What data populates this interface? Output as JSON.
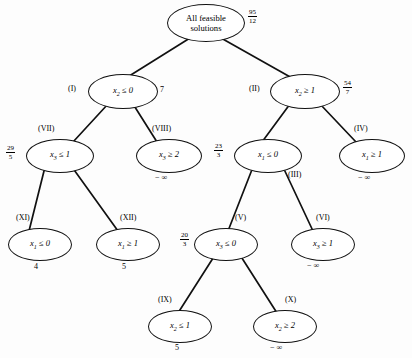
{
  "figure": {
    "edge_color": "#111111",
    "node_border_color": "#111111",
    "background": "#fdfdfd"
  },
  "nodes": [
    {
      "id": "root",
      "tag": "",
      "label_line1": "All feasible",
      "label_line2": "solutions",
      "bound_type": "fraction",
      "bound_num": "95",
      "bound_den": "12",
      "bound_text": "",
      "x": 167,
      "y": 4,
      "w": 76,
      "h": 36,
      "tag_x": 0,
      "tag_y": 0,
      "bound_x": 248,
      "bound_y": 9
    },
    {
      "id": "n1",
      "tag": "(I)",
      "label_var": "x",
      "label_sub": "2",
      "label_rel": "≤ 0",
      "bound_type": "plain",
      "bound_text": "7",
      "x": 88,
      "y": 74,
      "w": 68,
      "h": 33,
      "tag_x": 68,
      "tag_y": 84,
      "bound_x": 160,
      "bound_y": 85
    },
    {
      "id": "n2",
      "tag": "(II)",
      "label_var": "x",
      "label_sub": "2",
      "label_rel": "≥ 1",
      "bound_type": "fraction",
      "bound_num": "54",
      "bound_den": "7",
      "bound_text": "",
      "x": 270,
      "y": 74,
      "w": 68,
      "h": 33,
      "tag_x": 249,
      "tag_y": 84,
      "bound_x": 343,
      "bound_y": 80
    },
    {
      "id": "n7",
      "tag": "(VII)",
      "label_var": "x",
      "label_sub": "3",
      "label_rel": "≤ 1",
      "bound_type": "fraction",
      "bound_num": "29",
      "bound_den": "5",
      "bound_text": "",
      "x": 26,
      "y": 139,
      "w": 66,
      "h": 32,
      "tag_x": 38,
      "tag_y": 124,
      "bound_x": 6,
      "bound_y": 145
    },
    {
      "id": "n8",
      "tag": "(VIII)",
      "label_var": "x",
      "label_sub": "3",
      "label_rel": "≥ 2",
      "bound_type": "neginf",
      "bound_text": "− ∞",
      "x": 136,
      "y": 139,
      "w": 64,
      "h": 32,
      "tag_x": 152,
      "tag_y": 124,
      "bound_x": 155,
      "bound_y": 173
    },
    {
      "id": "n3",
      "tag": "(III)",
      "label_var": "x",
      "label_sub": "1",
      "label_rel": "≤ 0",
      "bound_type": "fraction",
      "bound_num": "23",
      "bound_den": "3",
      "bound_text": "",
      "x": 234,
      "y": 139,
      "w": 66,
      "h": 32,
      "tag_x": 288,
      "tag_y": 170,
      "bound_x": 214,
      "bound_y": 143
    },
    {
      "id": "n4",
      "tag": "(IV)",
      "label_var": "x",
      "label_sub": "1",
      "label_rel": "≥ 1",
      "bound_type": "neginf",
      "bound_text": "− ∞",
      "x": 339,
      "y": 139,
      "w": 64,
      "h": 32,
      "tag_x": 354,
      "tag_y": 124,
      "bound_x": 358,
      "bound_y": 173
    },
    {
      "id": "n11",
      "tag": "(XI)",
      "label_var": "x",
      "label_sub": "1",
      "label_rel": "≤ 0",
      "bound_type": "plain",
      "bound_text": "4",
      "x": 8,
      "y": 228,
      "w": 62,
      "h": 31,
      "tag_x": 16,
      "tag_y": 213,
      "bound_x": 34,
      "bound_y": 262
    },
    {
      "id": "n12",
      "tag": "(XII)",
      "label_var": "x",
      "label_sub": "1",
      "label_rel": "≥ 1",
      "bound_type": "plain",
      "bound_text": "5",
      "x": 96,
      "y": 228,
      "w": 62,
      "h": 31,
      "tag_x": 120,
      "tag_y": 213,
      "bound_x": 122,
      "bound_y": 262
    },
    {
      "id": "n5",
      "tag": "(V)",
      "label_var": "x",
      "label_sub": "3",
      "label_rel": "≤ 0",
      "bound_type": "fraction",
      "bound_num": "20",
      "bound_den": "3",
      "bound_text": "",
      "x": 194,
      "y": 228,
      "w": 62,
      "h": 31,
      "tag_x": 235,
      "tag_y": 213,
      "bound_x": 180,
      "bound_y": 232
    },
    {
      "id": "n6",
      "tag": "(VI)",
      "label_var": "x",
      "label_sub": "3",
      "label_rel": "≥ 1",
      "bound_type": "neginf",
      "bound_text": "− ∞",
      "x": 291,
      "y": 228,
      "w": 62,
      "h": 31,
      "tag_x": 316,
      "tag_y": 213,
      "bound_x": 307,
      "bound_y": 261
    },
    {
      "id": "n9",
      "tag": "(IX)",
      "label_var": "x",
      "label_sub": "2",
      "label_rel": "≤ 1",
      "bound_type": "plain",
      "bound_text": "5",
      "x": 148,
      "y": 310,
      "w": 62,
      "h": 31,
      "tag_x": 158,
      "tag_y": 295,
      "bound_x": 175,
      "bound_y": 343
    },
    {
      "id": "n10",
      "tag": "(X)",
      "label_var": "x",
      "label_sub": "2",
      "label_rel": "≥ 2",
      "bound_type": "neginf",
      "bound_text": "− ∞",
      "x": 253,
      "y": 310,
      "w": 62,
      "h": 31,
      "tag_x": 285,
      "tag_y": 295,
      "bound_x": 270,
      "bound_y": 343
    }
  ],
  "edges": [
    {
      "from": "root",
      "to": "n1",
      "x1": 190,
      "y1": 38,
      "x2": 126,
      "y2": 78
    },
    {
      "from": "root",
      "to": "n2",
      "x1": 221,
      "y1": 38,
      "x2": 292,
      "y2": 78
    },
    {
      "from": "n1",
      "to": "n7",
      "x1": 108,
      "y1": 104,
      "x2": 73,
      "y2": 142
    },
    {
      "from": "n1",
      "to": "n8",
      "x1": 133,
      "y1": 104,
      "x2": 157,
      "y2": 142
    },
    {
      "from": "n2",
      "to": "n3",
      "x1": 290,
      "y1": 104,
      "x2": 262,
      "y2": 142
    },
    {
      "from": "n2",
      "to": "n4",
      "x1": 320,
      "y1": 104,
      "x2": 356,
      "y2": 142
    },
    {
      "from": "n7",
      "to": "n11",
      "x1": 45,
      "y1": 167,
      "x2": 29,
      "y2": 231
    },
    {
      "from": "n7",
      "to": "n12",
      "x1": 72,
      "y1": 167,
      "x2": 118,
      "y2": 231
    },
    {
      "from": "n3",
      "to": "n5",
      "x1": 253,
      "y1": 167,
      "x2": 228,
      "y2": 231
    },
    {
      "from": "n3",
      "to": "n6",
      "x1": 283,
      "y1": 167,
      "x2": 313,
      "y2": 231
    },
    {
      "from": "n5",
      "to": "n9",
      "x1": 215,
      "y1": 255,
      "x2": 178,
      "y2": 313
    },
    {
      "from": "n5",
      "to": "n10",
      "x1": 240,
      "y1": 255,
      "x2": 277,
      "y2": 313
    }
  ]
}
